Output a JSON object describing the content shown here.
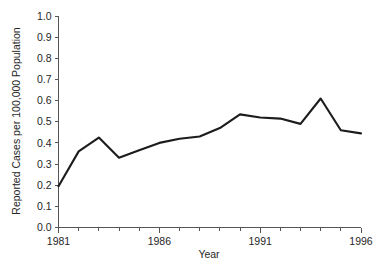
{
  "chart_data": {
    "type": "line",
    "title": "",
    "xlabel": "Year",
    "ylabel": "Reported Cases per 100,000 Population",
    "x": [
      1981,
      1982,
      1983,
      1984,
      1985,
      1986,
      1987,
      1988,
      1989,
      1990,
      1991,
      1992,
      1993,
      1994,
      1995,
      1996
    ],
    "values": [
      0.195,
      0.36,
      0.425,
      0.33,
      0.365,
      0.4,
      0.42,
      0.43,
      0.47,
      0.535,
      0.52,
      0.515,
      0.49,
      0.61,
      0.46,
      0.445
    ],
    "series": [
      {
        "name": "Reported Cases per 100,000 Population",
        "values": [
          0.195,
          0.36,
          0.425,
          0.33,
          0.365,
          0.4,
          0.42,
          0.43,
          0.47,
          0.535,
          0.52,
          0.515,
          0.49,
          0.61,
          0.46,
          0.445
        ]
      }
    ],
    "xlim": [
      1981,
      1996
    ],
    "ylim": [
      0.0,
      1.0
    ],
    "y_ticks": [
      "0.0",
      "0.1",
      "0.2",
      "0.3",
      "0.4",
      "0.5",
      "0.6",
      "0.7",
      "0.8",
      "0.9",
      "1.0"
    ],
    "y_tick_values": [
      0.0,
      0.1,
      0.2,
      0.3,
      0.4,
      0.5,
      0.6,
      0.7,
      0.8,
      0.9,
      1.0
    ],
    "x_ticks": [
      "1981",
      "1986",
      "1991",
      "1996"
    ],
    "x_tick_values": [
      1981,
      1986,
      1991,
      1996
    ],
    "x_minor_tick_values": [
      1982,
      1983,
      1984,
      1985,
      1987,
      1988,
      1989,
      1990,
      1992,
      1993,
      1994,
      1995
    ],
    "grid": false,
    "legend": false,
    "line_color": "#1c1c1c",
    "axis_color": "#555555",
    "background_color": "#ffffff"
  }
}
